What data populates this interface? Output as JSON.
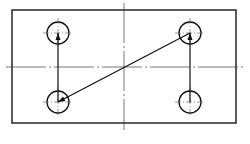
{
  "diagram": {
    "type": "toolpath-drilling-pattern",
    "colors": {
      "background": "#ffffff",
      "outline": "#333333",
      "center_line": "#555555",
      "path": "#111111"
    },
    "plate": {
      "x": 12,
      "y": 10,
      "width": 224,
      "height": 113
    },
    "center_lines": {
      "horizontal": {
        "y": 67,
        "x1": 6,
        "x2": 244
      },
      "vertical": {
        "x": 124,
        "y1": 3,
        "y2": 130
      }
    },
    "holes": [
      {
        "id": "top-left",
        "cx": 58,
        "cy": 33,
        "r": 11
      },
      {
        "id": "top-right",
        "cx": 190,
        "cy": 33,
        "r": 11
      },
      {
        "id": "bottom-left",
        "cx": 58,
        "cy": 102,
        "r": 11
      },
      {
        "id": "bottom-right",
        "cx": 190,
        "cy": 102,
        "r": 11
      }
    ],
    "path_segments": [
      {
        "from": "bottom-right",
        "to": "top-right",
        "x1": 190,
        "y1": 102,
        "x2": 190,
        "y2": 33,
        "arrow": "end"
      },
      {
        "from": "top-right",
        "to": "bottom-left",
        "x1": 190,
        "y1": 33,
        "x2": 58,
        "y2": 102,
        "arrow": "end"
      },
      {
        "from": "bottom-left",
        "to": "top-left",
        "x1": 58,
        "y1": 102,
        "x2": 58,
        "y2": 33,
        "arrow": "end"
      }
    ]
  }
}
